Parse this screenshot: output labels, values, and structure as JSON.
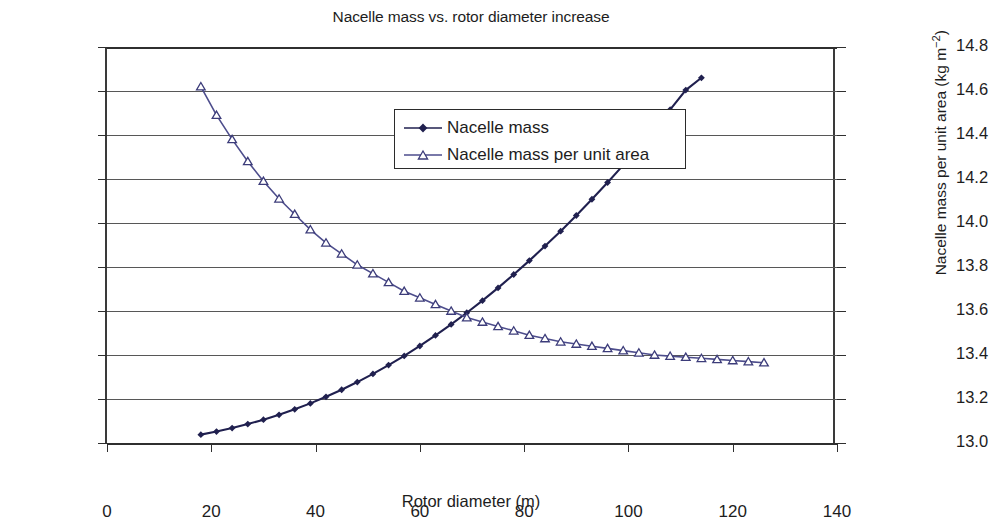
{
  "title": "Nacelle mass vs. rotor diameter increase",
  "axes": {
    "x": {
      "label": "Rotor diameter (m)",
      "ticks": [
        "0",
        "20",
        "40",
        "60",
        "80",
        "100",
        "120",
        "140"
      ],
      "min": 0,
      "max": 140
    },
    "y_left": {
      "label": "Nacelle mass (tons)",
      "ticks": [
        "0",
        "20",
        "40",
        "60",
        "80",
        "100",
        "120",
        "140",
        "160",
        "180"
      ],
      "min": 0,
      "max": 180
    },
    "y_right": {
      "label_main": "Nacelle mass per unit area (kg m",
      "label_sup": "−2",
      "label_tail": ")",
      "ticks": [
        "13.0",
        "13.2",
        "13.4",
        "13.6",
        "13.8",
        "14.0",
        "14.2",
        "14.4",
        "14.6",
        "14.8"
      ],
      "min": 13.0,
      "max": 14.8
    }
  },
  "legend": {
    "position": "top-center-inside",
    "items": [
      {
        "label": "Nacelle mass",
        "marker": "filled-diamond-icon",
        "color": "#2a2a5e"
      },
      {
        "label": "Nacelle mass per unit area",
        "marker": "open-triangle-icon",
        "color": "#4a4a86"
      }
    ]
  },
  "colors": {
    "series1": "#20204f",
    "series2": "#4d4d8c",
    "grid": "#575757",
    "axis": "#2f2f2f"
  },
  "chart_data": {
    "type": "line",
    "title": "Nacelle mass vs. rotor diameter increase",
    "xlabel": "Rotor diameter (m)",
    "ylabel": "Nacelle mass (tons)",
    "ylabel_secondary": "Nacelle mass per unit area (kg m^-2)",
    "xlim": [
      0,
      140
    ],
    "ylim": [
      0,
      180
    ],
    "ylim_secondary": [
      13.0,
      14.8
    ],
    "grid": true,
    "x": [
      18,
      21,
      24,
      27,
      30,
      33,
      36,
      39,
      42,
      45,
      48,
      51,
      54,
      57,
      60,
      63,
      66,
      69,
      72,
      75,
      78,
      81,
      84,
      87,
      90,
      93,
      96,
      99,
      102,
      105,
      108,
      111,
      114,
      117,
      120,
      123,
      126
    ],
    "series": [
      {
        "name": "Nacelle mass",
        "axis": "left",
        "unit": "tons",
        "marker": "filled diamond",
        "values": [
          3.8,
          5.2,
          6.8,
          8.6,
          10.6,
          12.8,
          15.3,
          18.0,
          21.0,
          24.2,
          27.7,
          31.4,
          35.4,
          39.6,
          44.1,
          48.9,
          53.9,
          59.2,
          64.7,
          70.5,
          76.6,
          82.9,
          89.5,
          96.3,
          103.4,
          110.8,
          118.4,
          126.3,
          134.4,
          142.8,
          151.5,
          160.4,
          166.0,
          166.0,
          166.0,
          166.0,
          166.0
        ]
      },
      {
        "name": "Nacelle mass per unit area",
        "axis": "right",
        "unit": "kg m^-2",
        "marker": "open triangle",
        "values": [
          14.62,
          14.49,
          14.38,
          14.28,
          14.19,
          14.11,
          14.04,
          13.97,
          13.91,
          13.86,
          13.81,
          13.77,
          13.73,
          13.69,
          13.66,
          13.63,
          13.6,
          13.57,
          13.55,
          13.53,
          13.51,
          13.49,
          13.475,
          13.46,
          13.45,
          13.44,
          13.43,
          13.42,
          13.41,
          13.4,
          13.395,
          13.39,
          13.385,
          13.38,
          13.375,
          13.37,
          13.365
        ]
      }
    ],
    "annotations": [
      {
        "text": "curves cross",
        "x": 78,
        "y_left": 63,
        "y_right": 13.68
      }
    ]
  }
}
